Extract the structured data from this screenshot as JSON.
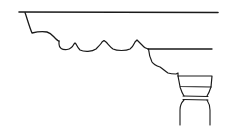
{
  "figure": {
    "colors": {
      "ink": "#1a1a1a",
      "background": "#ffffff"
    },
    "elements": [
      {
        "name": "upper-fascia-line"
      },
      {
        "name": "upper-cyma-profile"
      },
      {
        "name": "dentil-scallop-band"
      },
      {
        "name": "lower-fascia-line"
      },
      {
        "name": "lower-ogee-profile"
      },
      {
        "name": "capital-abacus"
      },
      {
        "name": "capital-echinus"
      },
      {
        "name": "capital-necking-band"
      },
      {
        "name": "column-shaft"
      }
    ]
  }
}
